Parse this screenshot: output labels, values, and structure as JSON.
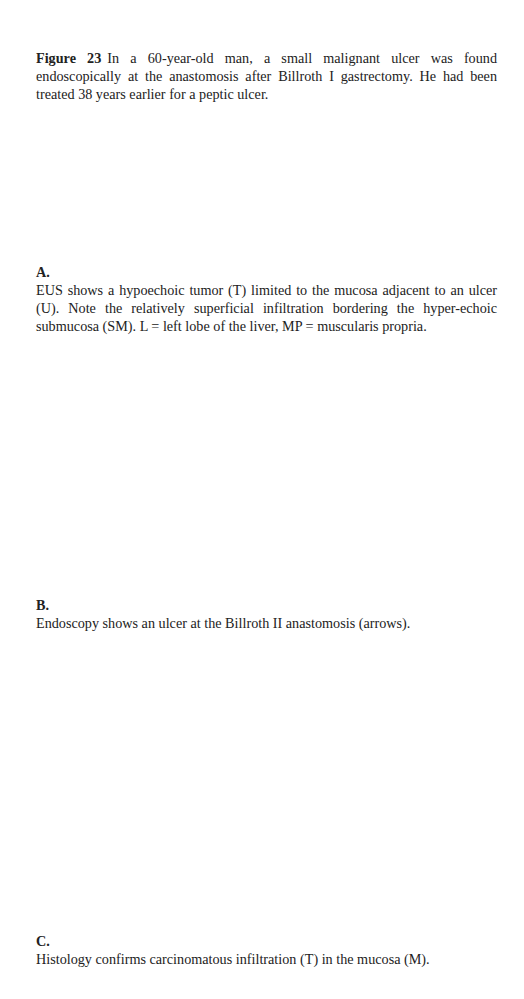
{
  "figure": {
    "label": "Figure 23",
    "caption": "In a 60-year-old man, a small malignant ulcer was found endoscopically at the anastomosis after Billroth I gastrectomy. He had been treated 38 years earlier for a peptic ulcer."
  },
  "panels": [
    {
      "label": "A.",
      "text": "EUS shows a hypoechoic tumor (T) limited to the mucosa adjacent to an ulcer (U). Note the relatively superficial infiltration bordering the hyper-echoic submucosa (SM). L = left lobe of the liver, MP = muscularis propria."
    },
    {
      "label": "B.",
      "text": "Endoscopy shows an ulcer at the Billroth II anastomosis (arrows)."
    },
    {
      "label": "C.",
      "text": "Histology confirms carcinomatous infiltration (T) in the mucosa (M)."
    }
  ]
}
